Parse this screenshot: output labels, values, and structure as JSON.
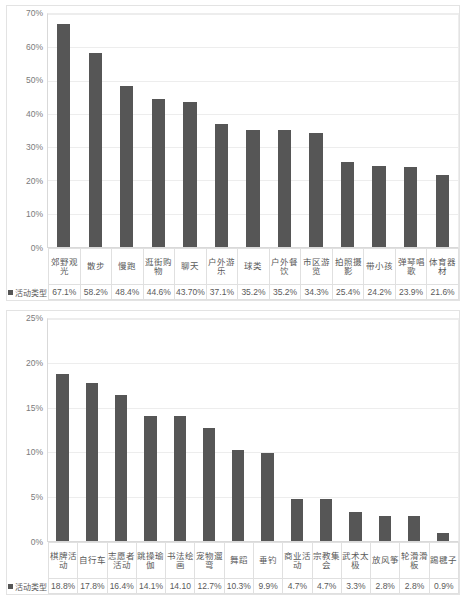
{
  "document": {
    "kind": "two-stacked-bar-charts",
    "background_color": "#ffffff",
    "bar_color": "#565656",
    "gridline_color": "#ededed",
    "text_color": "#595959"
  },
  "chart_data": [
    {
      "type": "bar",
      "title": "",
      "xlabel": "",
      "ylabel": "",
      "ylim": [
        0,
        70
      ],
      "grid": true,
      "legend_position": "bottom-left",
      "legend": [
        "活动类型"
      ],
      "y_ticks": [
        "0%",
        "10%",
        "20%",
        "30%",
        "40%",
        "50%",
        "60%",
        "70%"
      ],
      "y_tick_values": [
        0,
        10,
        20,
        30,
        40,
        50,
        60,
        70
      ],
      "categories": [
        "郊野观光",
        "散步",
        "慢跑",
        "逛街购物",
        "聊天",
        "户外游乐",
        "球类",
        "户外餐饮",
        "市区游览",
        "拍照摄影",
        "带小孩",
        "弹琴唱歌",
        "体育器材"
      ],
      "values": [
        67.1,
        58.2,
        48.4,
        44.6,
        43.7,
        37.1,
        35.2,
        35.2,
        34.3,
        25.4,
        24.2,
        23.9,
        21.6
      ],
      "value_labels": [
        "67.1%",
        "58.2%",
        "48.4%",
        "44.6%",
        "43.70%",
        "37.1%",
        "35.2%",
        "35.2%",
        "34.3%",
        "25.4%",
        "24.2%",
        "23.9%",
        "21.6%"
      ],
      "series_name": "活动类型"
    },
    {
      "type": "bar",
      "title": "",
      "xlabel": "",
      "ylabel": "",
      "ylim": [
        0,
        25
      ],
      "grid": true,
      "legend_position": "bottom-left",
      "legend": [
        "活动类型"
      ],
      "y_ticks": [
        "0%",
        "5%",
        "10%",
        "15%",
        "20%",
        "25%"
      ],
      "y_tick_values": [
        0,
        5,
        10,
        15,
        20,
        25
      ],
      "categories": [
        "棋牌活动",
        "自行车",
        "志愿者活动",
        "跳操瑜伽",
        "书法绘画",
        "宠物遛弯",
        "舞蹈",
        "垂钓",
        "商业活动",
        "宗教集会",
        "武术太极",
        "放风筝",
        "轮滑滑板",
        "踢毽子"
      ],
      "values": [
        18.8,
        17.8,
        16.4,
        14.1,
        14.1,
        12.7,
        10.3,
        9.9,
        4.7,
        4.7,
        3.3,
        2.8,
        2.8,
        0.9
      ],
      "value_labels": [
        "18.8%",
        "17.8%",
        "16.4%",
        "14.1%",
        "14.10",
        "12.7%",
        "10.3%",
        "9.9%",
        "4.7%",
        "4.7%",
        "3.3%",
        "2.8%",
        "2.8%",
        "0.9%"
      ],
      "series_name": "活动类型"
    }
  ]
}
